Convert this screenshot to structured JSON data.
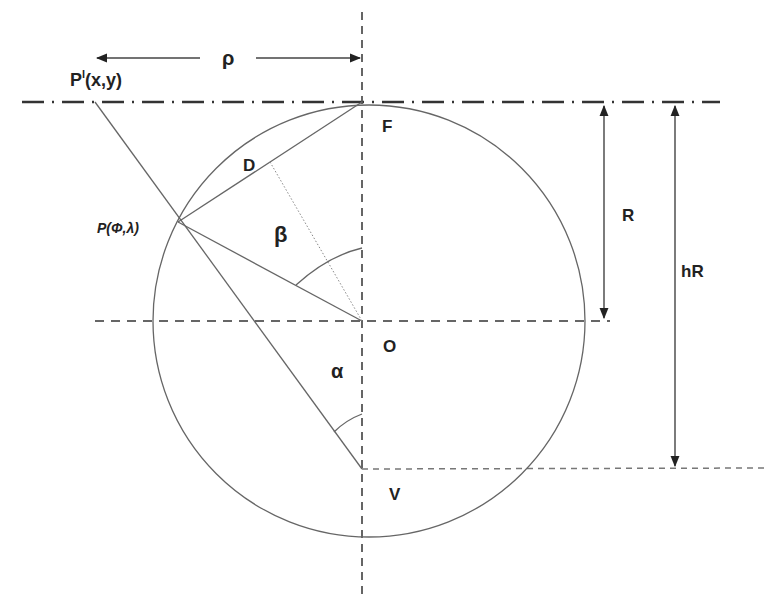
{
  "diagram": {
    "type": "geometry",
    "colors": {
      "line": "#555555",
      "dash": "#555555",
      "text": "#222222",
      "background": "#ffffff"
    },
    "points": {
      "P_prime": {
        "label": "P",
        "sup": "l",
        "coords": "(x,y)"
      },
      "P": {
        "label": "P(Φ,λ)"
      },
      "F": {
        "label": "F"
      },
      "D": {
        "label": "D"
      },
      "O": {
        "label": "O"
      },
      "V": {
        "label": "V"
      }
    },
    "angles": {
      "beta": {
        "label": "β"
      },
      "alpha": {
        "label": "α"
      }
    },
    "dimensions": {
      "rho": {
        "label": "ρ"
      },
      "R": {
        "label": "R"
      },
      "hR": {
        "label": "hR"
      }
    }
  }
}
